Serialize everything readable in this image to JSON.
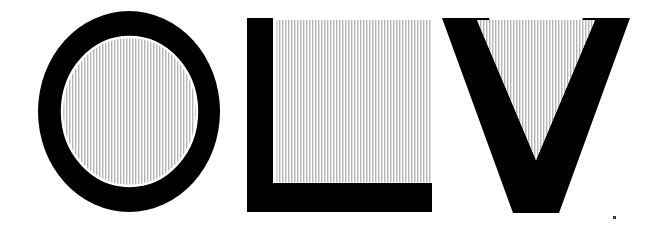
{
  "artwork": {
    "title": "OLV",
    "type": "monogram-letterforms",
    "background_color": "#ffffff",
    "ink_color": "#000000",
    "canvas": {
      "width": 667,
      "height": 237
    }
  },
  "hatch": {
    "name": "vertical-stripe-hatch",
    "stripe_color": "#b4b4b4",
    "gap_color": "#ffffff",
    "pitch_px": 3,
    "stripe_width_px": 1.4,
    "orientation": "vertical"
  },
  "letters": [
    {
      "id": "letter-o",
      "character": "O",
      "shape": "ring",
      "outer_bounds": {
        "x": 38,
        "y": 11,
        "width": 182,
        "height": 201
      },
      "inner_bounds": {
        "x": 62,
        "y": 37,
        "width": 135,
        "height": 149
      },
      "stroke_px": 24,
      "fill": "#000000",
      "interior_fill": "vertical-stripe-hatch"
    },
    {
      "id": "letter-l",
      "character": "L",
      "shape": "ell",
      "outer_bounds": {
        "x": 247,
        "y": 18,
        "width": 185,
        "height": 194
      },
      "stem_width_px": 26,
      "foot_height_px": 29,
      "panel_bounds": {
        "x": 276,
        "y": 20,
        "width": 156,
        "height": 163
      },
      "fill": "#000000",
      "interior_fill": "vertical-stripe-hatch"
    },
    {
      "id": "letter-v",
      "character": "V",
      "shape": "chevron",
      "outer_bounds": {
        "x": 442,
        "y": 18,
        "width": 188,
        "height": 195
      },
      "apex_x": 536,
      "stroke_px": 47,
      "panel_triangle": {
        "left_x": 477,
        "right_x": 595,
        "top_y": 20,
        "tip_y": 160
      },
      "fill": "#000000",
      "interior_fill": "vertical-stripe-hatch"
    }
  ],
  "specks": [
    {
      "x": 613,
      "y": 216,
      "size": 3
    }
  ]
}
